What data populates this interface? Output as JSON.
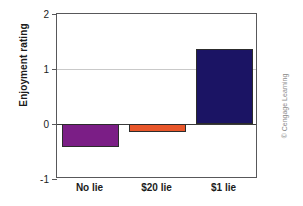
{
  "chart_data": {
    "type": "bar",
    "title": "",
    "subtitle": "",
    "xlabel": "",
    "ylabel": "Enjoyment rating",
    "categories": [
      "No lie",
      "$20 lie",
      "$1 lie"
    ],
    "values": [
      -0.42,
      -0.15,
      1.37
    ],
    "series": [
      {
        "name": "Enjoyment rating",
        "values": [
          -0.42,
          -0.15,
          1.37
        ]
      }
    ],
    "bar_colors": [
      "#7b1e86",
      "#e8562a",
      "#1b1464"
    ],
    "ylim": [
      -1,
      2
    ],
    "yticks": [
      2,
      1,
      0,
      -1
    ],
    "ytick_labels": [
      "2",
      "1",
      "0",
      "-1"
    ],
    "grid": "horizontal-at-y1",
    "zero_line": 0,
    "legend": "none",
    "annotations": []
  },
  "figure": {
    "credit": "© Cengage Learning",
    "axis_color": "#58585a",
    "grid_color": "#c9c9c9",
    "zero_line_color": "#3a3a3a",
    "background": "#ffffff"
  }
}
